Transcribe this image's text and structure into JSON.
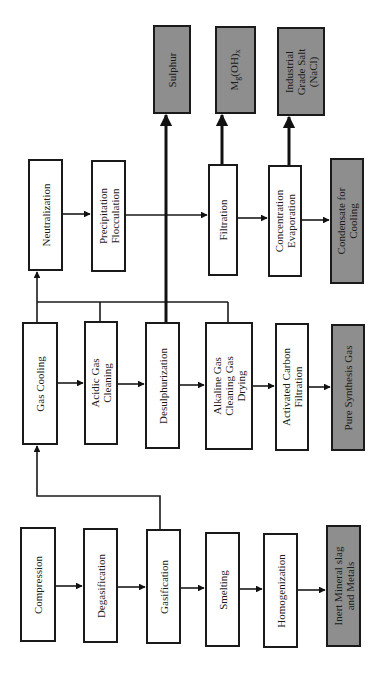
{
  "diagram": {
    "orientation": "rotated-90-ccw",
    "colors": {
      "process_fill": "#ffffff",
      "output_fill": "#8e8e8e",
      "stroke": "#1a1a1a"
    },
    "outputs_top": {
      "sulphur": "Sulphur",
      "mg_oh": "Mg(OH)x",
      "nacl": "Industrial\nGrade Salt\n(NaCl)"
    },
    "water_treatment": {
      "neutralization": "Neutralization",
      "precipitation": "Precipitation\nFlocculation",
      "filtration": "Filtration",
      "concentration": "Concentration\nEvaporation",
      "condensate": "Condensate for\nCooling"
    },
    "gas_cleaning": {
      "gas_cooling": "Gas Cooling",
      "acidic": "Acidic Gas\nCleaning",
      "desulph": "Desulphurization",
      "alkaline": "Alkaline Gas\nCleaning Gas\nDrying",
      "activated": "Activated Carbon\nFiltration",
      "pure_gas": "Pure Synthesis Gas"
    },
    "waste_processing": {
      "compression": "Compression",
      "degasification": "Degasification",
      "gasification": "Gasification",
      "smelting": "Smelting",
      "homogenization": "Homogenization",
      "slag": "Inert Mineral slag\nand Metals"
    }
  }
}
